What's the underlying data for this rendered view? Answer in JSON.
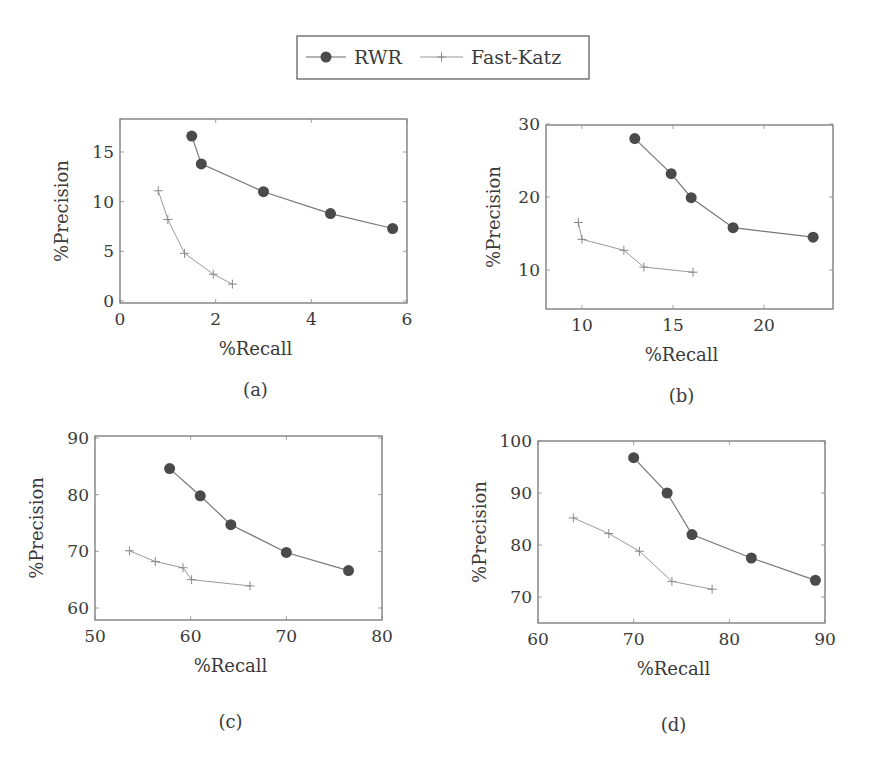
{
  "legend": {
    "entries": [
      {
        "label": "RWR",
        "marker": "filled-circle",
        "color": "#4a4a4a"
      },
      {
        "label": "Fast-Katz",
        "marker": "plus",
        "color": "#8a8a8a"
      }
    ]
  },
  "chart_data": [
    {
      "type": "line",
      "caption": "(a)",
      "xlabel": "%Recall",
      "ylabel": "%Precision",
      "xlim": [
        0,
        6
      ],
      "ylim": [
        0,
        18.5
      ],
      "xticks": [
        0,
        2,
        4,
        6
      ],
      "yticks": [
        0,
        5,
        10,
        15
      ],
      "grid": false,
      "series": [
        {
          "name": "RWR",
          "x": [
            1.5,
            1.7,
            3.0,
            4.4,
            5.7
          ],
          "y": [
            16.6,
            13.8,
            11.0,
            8.8,
            7.3
          ]
        },
        {
          "name": "Fast-Katz",
          "x": [
            0.8,
            1.0,
            1.35,
            1.95,
            2.35
          ],
          "y": [
            11.1,
            8.2,
            4.8,
            2.7,
            1.7
          ]
        }
      ]
    },
    {
      "type": "line",
      "caption": "(b)",
      "xlabel": "%Recall",
      "ylabel": "%Precision",
      "xlim": [
        8,
        24
      ],
      "ylim": [
        5,
        30
      ],
      "xticks": [
        10,
        15,
        20
      ],
      "yticks": [
        10,
        20,
        30
      ],
      "grid": false,
      "series": [
        {
          "name": "RWR",
          "x": [
            12.9,
            14.9,
            16.0,
            18.3,
            22.7
          ],
          "y": [
            28.0,
            23.2,
            19.9,
            15.8,
            14.5
          ]
        },
        {
          "name": "Fast-Katz",
          "x": [
            9.8,
            10.0,
            12.3,
            13.4,
            16.1
          ],
          "y": [
            16.5,
            14.2,
            12.7,
            10.4,
            9.7
          ]
        }
      ]
    },
    {
      "type": "line",
      "caption": "(c)",
      "xlabel": "%Recall",
      "ylabel": "%Precision",
      "xlim": [
        50,
        80
      ],
      "ylim": [
        58,
        90
      ],
      "xticks": [
        50,
        60,
        70,
        80
      ],
      "yticks": [
        60,
        70,
        80,
        90
      ],
      "grid": false,
      "series": [
        {
          "name": "RWR",
          "x": [
            57.8,
            61.0,
            64.2,
            70.0,
            76.5
          ],
          "y": [
            84.6,
            79.8,
            74.7,
            69.8,
            66.6
          ]
        },
        {
          "name": "Fast-Katz",
          "x": [
            53.6,
            56.3,
            59.2,
            60.1,
            66.2
          ],
          "y": [
            70.1,
            68.2,
            67.1,
            65.0,
            63.9
          ]
        }
      ]
    },
    {
      "type": "line",
      "caption": "(d)",
      "xlabel": "%Recall",
      "ylabel": "%Precision",
      "xlim": [
        60,
        90
      ],
      "ylim": [
        65,
        100
      ],
      "xticks": [
        60,
        70,
        80,
        90
      ],
      "yticks": [
        70,
        80,
        90,
        100
      ],
      "grid": false,
      "series": [
        {
          "name": "RWR",
          "x": [
            70.0,
            73.5,
            76.1,
            82.3,
            89.0
          ],
          "y": [
            96.8,
            90.0,
            82.0,
            77.5,
            73.2
          ]
        },
        {
          "name": "Fast-Katz",
          "x": [
            63.7,
            67.4,
            70.6,
            74.0,
            78.2
          ],
          "y": [
            85.2,
            82.2,
            78.8,
            73.0,
            71.5
          ]
        }
      ]
    }
  ],
  "layout_frames": [
    {
      "left": 120,
      "top": 119,
      "right": 407,
      "bottom": 303,
      "ymap": [
        0,
        301,
        15,
        152
      ]
    },
    {
      "left": 546,
      "top": 125,
      "right": 833,
      "bottom": 309,
      "ymap": [
        10,
        270,
        30,
        124
      ],
      "xmap": [
        10,
        582,
        20,
        764
      ]
    },
    {
      "left": 95,
      "top": 436,
      "right": 382,
      "bottom": 620,
      "ymap": [
        60,
        608,
        90,
        438
      ],
      "xmap": [
        50,
        95,
        80,
        382
      ]
    },
    {
      "left": 538,
      "top": 441,
      "right": 825,
      "bottom": 623,
      "ymap": [
        70,
        597,
        100,
        441
      ],
      "xmap": [
        60,
        538,
        90,
        825
      ]
    }
  ]
}
